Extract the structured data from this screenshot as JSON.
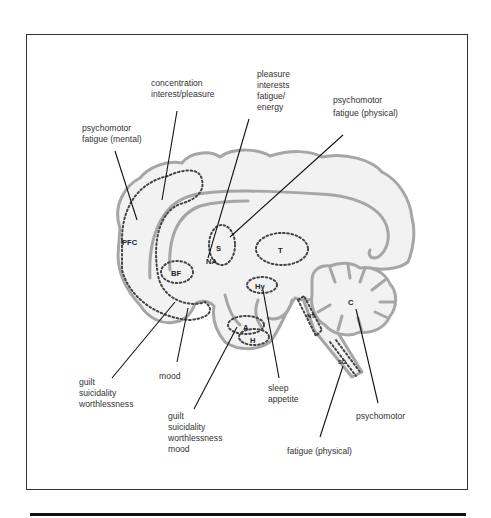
{
  "figure": {
    "type": "brain-sagittal-diagram",
    "colors": {
      "brain_fill": "#f2f2f2",
      "brain_outline": "#a6a6a6",
      "region_dots": "#444444",
      "leader_lines": "#111111",
      "frame": "#333333"
    },
    "regions": [
      {
        "id": "pfc",
        "label": "PFC"
      },
      {
        "id": "s",
        "label": "S"
      },
      {
        "id": "na",
        "label": "NA"
      },
      {
        "id": "t",
        "label": "T"
      },
      {
        "id": "bf",
        "label": "BF"
      },
      {
        "id": "hy",
        "label": "Hy"
      },
      {
        "id": "a",
        "label": "A"
      },
      {
        "id": "h",
        "label": "H"
      },
      {
        "id": "c",
        "label": "C"
      },
      {
        "id": "nt",
        "label": "NT"
      },
      {
        "id": "sc",
        "label": "SC"
      }
    ],
    "annotations": {
      "concentration": [
        "concentration",
        "interest/pleasure"
      ],
      "psychomotor_mental": [
        "psychomotor",
        "fatigue (mental)"
      ],
      "pleasure": [
        "pleasure",
        "interests",
        "fatigue/",
        "energy"
      ],
      "psychomotor_physical": [
        "psychomotor",
        "fatigue (physical)"
      ],
      "guilt_left": [
        "guilt",
        "suicidality",
        "worthlessness"
      ],
      "mood": [
        "mood"
      ],
      "guilt_center": [
        "guilt",
        "suicidality",
        "worthlessness",
        "mood"
      ],
      "sleep": [
        "sleep",
        "appetite"
      ],
      "psychomotor_c": [
        "psychomotor"
      ],
      "fatigue_physical": [
        "fatigue (physical)"
      ]
    }
  }
}
